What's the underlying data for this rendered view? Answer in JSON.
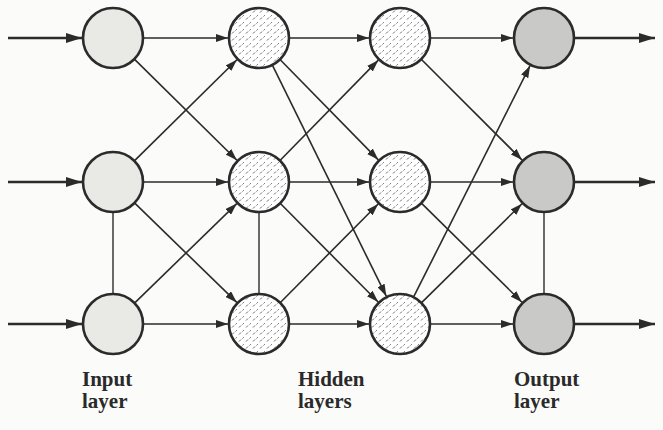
{
  "diagram": {
    "layers": [
      {
        "id": "input",
        "label_line1": "Input",
        "label_line2": "layer",
        "fill": "#e9e9e6",
        "pattern": "none",
        "x": 113,
        "label_x": 82,
        "label_y": 368
      },
      {
        "id": "hidden1",
        "label_line1": "",
        "label_line2": "",
        "fill": "#ffffff",
        "pattern": "dashes",
        "x": 259
      },
      {
        "id": "hidden2",
        "label_line1": "",
        "label_line2": "",
        "fill": "#ffffff",
        "pattern": "dashes",
        "x": 400
      },
      {
        "id": "output",
        "label_line1": "Output",
        "label_line2": "layer",
        "fill": "#c9c9c7",
        "pattern": "none",
        "x": 544,
        "label_x": 514,
        "label_y": 368
      }
    ],
    "hidden_label": {
      "line1": "Hidden",
      "line2": "layers",
      "x": 298,
      "y": 368
    },
    "rows_y": [
      38,
      182,
      324
    ],
    "node_radius": 30,
    "colors": {
      "stroke": "#2b2b2b",
      "background": "#fbfbf9"
    },
    "input_arrows": [
      {
        "from_x": 8,
        "row": 0
      },
      {
        "from_x": 8,
        "row": 1
      },
      {
        "from_x": 8,
        "row": 2
      }
    ],
    "output_arrows": [
      {
        "to_x": 655,
        "row": 0
      },
      {
        "to_x": 655,
        "row": 1
      },
      {
        "to_x": 655,
        "row": 2
      }
    ],
    "edges": [
      {
        "from": [
          0,
          0
        ],
        "to": [
          1,
          0
        ]
      },
      {
        "from": [
          0,
          0
        ],
        "to": [
          1,
          1
        ]
      },
      {
        "from": [
          0,
          1
        ],
        "to": [
          1,
          0
        ]
      },
      {
        "from": [
          0,
          1
        ],
        "to": [
          1,
          1
        ]
      },
      {
        "from": [
          0,
          1
        ],
        "to": [
          1,
          2
        ]
      },
      {
        "from": [
          0,
          2
        ],
        "to": [
          1,
          1
        ]
      },
      {
        "from": [
          0,
          2
        ],
        "to": [
          1,
          2
        ]
      },
      {
        "from": [
          1,
          0
        ],
        "to": [
          2,
          0
        ]
      },
      {
        "from": [
          1,
          0
        ],
        "to": [
          2,
          1
        ]
      },
      {
        "from": [
          1,
          0
        ],
        "to": [
          2,
          2
        ]
      },
      {
        "from": [
          1,
          1
        ],
        "to": [
          2,
          0
        ]
      },
      {
        "from": [
          1,
          1
        ],
        "to": [
          2,
          1
        ]
      },
      {
        "from": [
          1,
          1
        ],
        "to": [
          2,
          2
        ]
      },
      {
        "from": [
          1,
          2
        ],
        "to": [
          2,
          1
        ]
      },
      {
        "from": [
          1,
          2
        ],
        "to": [
          2,
          2
        ]
      },
      {
        "from": [
          2,
          0
        ],
        "to": [
          3,
          0
        ]
      },
      {
        "from": [
          2,
          0
        ],
        "to": [
          3,
          1
        ]
      },
      {
        "from": [
          2,
          1
        ],
        "to": [
          3,
          1
        ]
      },
      {
        "from": [
          2,
          1
        ],
        "to": [
          3,
          2
        ]
      },
      {
        "from": [
          2,
          2
        ],
        "to": [
          3,
          0
        ]
      },
      {
        "from": [
          2,
          2
        ],
        "to": [
          3,
          1
        ]
      },
      {
        "from": [
          2,
          2
        ],
        "to": [
          3,
          2
        ]
      }
    ],
    "lateral_links": [
      {
        "layer": 0,
        "from_row": 1,
        "to_row": 2
      },
      {
        "layer": 1,
        "from_row": 1,
        "to_row": 2
      },
      {
        "layer": 3,
        "from_row": 1,
        "to_row": 2
      }
    ]
  }
}
